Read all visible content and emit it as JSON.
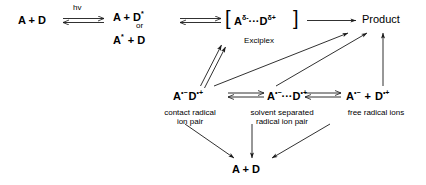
{
  "diagram": {
    "species": {
      "ground_pair": "A  +  D",
      "excited_dononor": "A  +  D",
      "excited_dononor_sup": "*",
      "or_label": "or",
      "excited_acceptor_pre": "A",
      "excited_acceptor_sup": "*",
      "excited_acceptor_post": "+  D",
      "exciplex_a": "A",
      "exciplex_a_sup": "δ-",
      "exciplex_dots": "···",
      "exciplex_d": "D",
      "exciplex_d_sup": "δ+",
      "bracket_left": "[",
      "bracket_right": "]",
      "product": "Product",
      "crip_a": "A",
      "crip_a_sup": "•−",
      "crip_d": "D",
      "crip_d_sup": "•+",
      "ssrip_a": "A",
      "ssrip_a_sup": "•−",
      "ssrip_dots": "···",
      "ssrip_d": "D",
      "ssrip_d_sup": "•+",
      "fri_a": "A",
      "fri_a_sup": "•−",
      "fri_plus": "+",
      "fri_d": "D",
      "fri_d_sup": "•+",
      "bottom_pair": "A  +  D"
    },
    "labels": {
      "hv": "hv",
      "exciplex": "Exciplex",
      "contact_pair_line1": "contact radical",
      "contact_pair_line2": "ion pair",
      "ssrip_line1": "solvent separated",
      "ssrip_line2": "radical ion pair",
      "free_ions": "free radical ions"
    },
    "colors": {
      "stroke": "#1a1a1a",
      "text": "#000000",
      "background": "#ffffff"
    }
  }
}
